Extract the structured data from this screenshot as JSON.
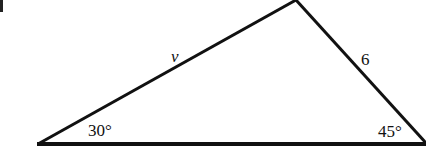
{
  "diagram": {
    "type": "triangle",
    "sides": {
      "left": {
        "label": "v"
      },
      "right": {
        "label": "6"
      }
    },
    "angles": {
      "left": {
        "label": "30°"
      },
      "right": {
        "label": "45°"
      }
    },
    "colors": {
      "stroke": "#111111",
      "background": "#ffffff"
    }
  }
}
